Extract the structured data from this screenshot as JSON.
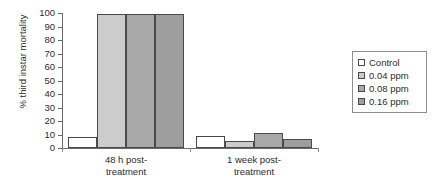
{
  "chart_data": {
    "type": "bar",
    "title": "",
    "subtitle": "",
    "xlabel": "",
    "ylabel": "% third instar mortality",
    "ylim": [
      0,
      100
    ],
    "yticks": [
      0,
      10,
      20,
      30,
      40,
      50,
      60,
      70,
      80,
      90,
      100
    ],
    "ytick_labels": [
      "0",
      "10",
      "20",
      "30",
      "40",
      "50",
      "60",
      "70",
      "80",
      "90",
      "100"
    ],
    "grid": false,
    "legend_position": "right",
    "categories": [
      "48 h post-treatment",
      "1 week post-treatment"
    ],
    "category_lines": [
      [
        "48 h post-",
        "treatment"
      ],
      [
        "1 week post-",
        "treatment"
      ]
    ],
    "series": [
      {
        "name": "Control",
        "values": [
          8,
          9
        ],
        "color": "#ffffff"
      },
      {
        "name": "0.04 ppm",
        "values": [
          99,
          5
        ],
        "color": "#cccccc"
      },
      {
        "name": "0.08 ppm",
        "values": [
          99,
          11
        ],
        "color": "#a8a8a8"
      },
      {
        "name": "0.16 ppm",
        "values": [
          99,
          7
        ],
        "color": "#9e9e9e"
      }
    ],
    "bar_edge_color": "#4a4a4a",
    "axis_color": "#6a6a6a"
  },
  "legend": {
    "items": [
      {
        "label": "Control"
      },
      {
        "label": "0.04 ppm"
      },
      {
        "label": "0.08 ppm"
      },
      {
        "label": "0.16 ppm"
      }
    ]
  }
}
